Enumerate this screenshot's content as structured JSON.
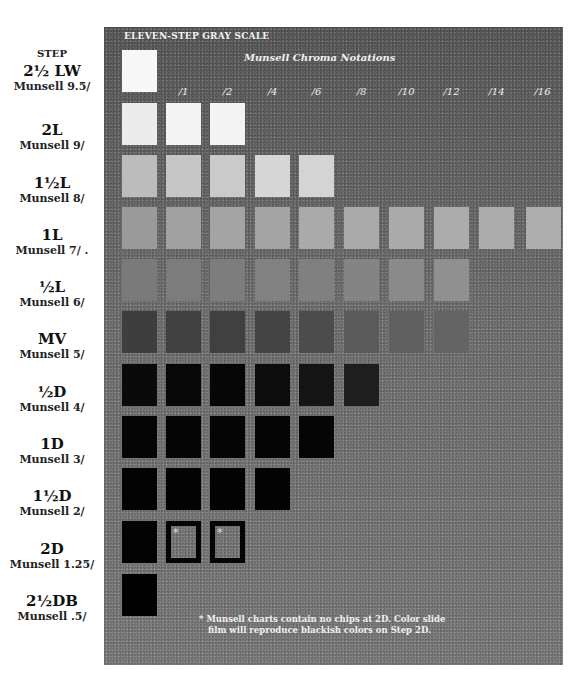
{
  "title": "ELEVEN-STEP GRAY SCALE",
  "subtitle": "Munsell Chroma Notations",
  "step_header": "STEP",
  "columns": [
    "",
    "/1",
    "/2",
    "/4",
    "/6",
    "/8",
    "/10",
    "/12",
    "/14",
    "/16"
  ],
  "rows": [
    {
      "code": "2½ LW",
      "munsell": "Munsell 9.5/",
      "chips": [
        "#f7f7f7"
      ]
    },
    {
      "code": "2L",
      "munsell": "Munsell 9/",
      "chips": [
        "#ececec",
        "#f4f4f4",
        "#f4f4f4"
      ]
    },
    {
      "code": "1½L",
      "munsell": "Munsell 8/",
      "chips": [
        "#bcbcbc",
        "#c6c6c6",
        "#cacaca",
        "#d6d6d6",
        "#d4d4d4"
      ]
    },
    {
      "code": "1L",
      "munsell": "Munsell 7/ .",
      "chips": [
        "#9a9a9a",
        "#a0a0a0",
        "#a4a4a4",
        "#a4a4a4",
        "#aaaaaa",
        "#aaaaaa",
        "#ababab",
        "#acacac",
        "#acacac",
        "#adadad"
      ]
    },
    {
      "code": "½L",
      "munsell": "Munsell 6/",
      "chips": [
        "#7a7a7a",
        "#7c7c7c",
        "#7d7d7d",
        "#818181",
        "#808080",
        "#848484",
        "#8a8a8a",
        "#909090"
      ]
    },
    {
      "code": "MV",
      "munsell": "Munsell 5/",
      "chips": [
        "#3e3e3e",
        "#404040",
        "#404040",
        "#444444",
        "#4c4c4c",
        "#5a5a5a",
        "#606060",
        "#646464"
      ]
    },
    {
      "code": "½D",
      "munsell": "Munsell 4/",
      "chips": [
        "#0a0a0a",
        "#070707",
        "#060606",
        "#0c0c0c",
        "#141414",
        "#1e1e1e"
      ]
    },
    {
      "code": "1D",
      "munsell": "Munsell 3/",
      "chips": [
        "#050505",
        "#050505",
        "#050505",
        "#050505",
        "#050505"
      ]
    },
    {
      "code": "1½D",
      "munsell": "Munsell 2/",
      "chips": [
        "#030303",
        "#030303",
        "#030303",
        "#030303"
      ]
    },
    {
      "code": "2D",
      "munsell": "Munsell 1.25/",
      "chips": [
        "#030303",
        "hollow",
        "hollow"
      ]
    },
    {
      "code": "2½DB",
      "munsell": "Munsell .5/",
      "chips": [
        "#020202"
      ]
    }
  ],
  "hollow_marker": "*",
  "footnote": {
    "line1": "* Munsell charts contain no chips at 2D. Color slide",
    "line2": "film will reproduce blackish colors on Step 2D."
  },
  "chart_data": {
    "type": "heatmap",
    "title": "ELEVEN-STEP GRAY SCALE",
    "subtitle": "Munsell Chroma Notations",
    "xlabel": "Munsell Chroma",
    "ylabel": "STEP",
    "x": [
      "/0 (neutral)",
      "/1",
      "/2",
      "/4",
      "/6",
      "/8",
      "/10",
      "/12",
      "/14",
      "/16"
    ],
    "y": [
      "2½LW (9.5/)",
      "2L (9/)",
      "1½L (8/)",
      "1L (7/)",
      "½L (6/)",
      "MV (5/)",
      "½D (4/)",
      "1D (3/)",
      "1½D (2/)",
      "2D (1.25/)",
      "2½DB (.5/)"
    ],
    "munsell_values": [
      9.5,
      9,
      8,
      7,
      6,
      5,
      4,
      3,
      2,
      1.25,
      0.5
    ],
    "chips_per_row": [
      1,
      3,
      5,
      10,
      8,
      8,
      6,
      5,
      4,
      3,
      1
    ],
    "missing_chips": [
      {
        "row": "2D",
        "columns": [
          "/1",
          "/2"
        ],
        "note": "Munsell charts contain no chips at 2D"
      }
    ],
    "grid": false,
    "legend": "none"
  }
}
